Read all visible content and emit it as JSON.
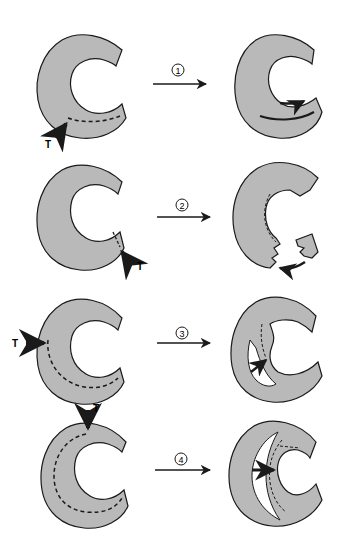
{
  "diagram": {
    "colors": {
      "fill": "#b9b9b9",
      "stroke": "#1a1a1a",
      "background": "#ffffff"
    },
    "rows": [
      {
        "step": "1",
        "tear_label": "T"
      },
      {
        "step": "2",
        "tear_label": "T"
      },
      {
        "step": "3",
        "tear_label": "T"
      },
      {
        "step": "4",
        "tear_label": "T"
      }
    ]
  }
}
